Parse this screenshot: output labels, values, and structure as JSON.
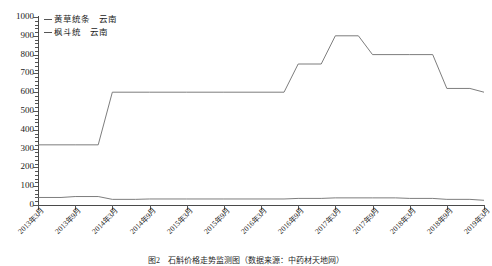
{
  "chart_data": {
    "type": "line",
    "title": "",
    "xlabel": "",
    "ylabel": "",
    "ylim": [
      0,
      1000
    ],
    "ytick_step": 100,
    "grid": false,
    "legend_position": "top-left",
    "categories": [
      "2013年3月",
      "2013年9月",
      "2014年3月",
      "2014年9月",
      "2015年3月",
      "2015年9月",
      "2016年3月",
      "2016年9月",
      "2017年3月",
      "2017年9月",
      "2018年3月",
      "2018年9月",
      "2019年3月"
    ],
    "yticks": [
      "0",
      "100",
      "200",
      "300",
      "400",
      "500",
      "600",
      "700",
      "800",
      "900",
      "1000"
    ],
    "series": [
      {
        "name": "黄草统条　云南",
        "color": "#6e6e6e",
        "values": [
          320,
          320,
          600,
          600,
          600,
          600,
          600,
          750,
          900,
          800,
          800,
          620,
          600
        ]
      },
      {
        "name": "枫斗统　云南",
        "color": "#6e6e6e",
        "values": [
          40,
          45,
          30,
          32,
          32,
          32,
          32,
          35,
          38,
          38,
          35,
          30,
          25
        ]
      }
    ]
  },
  "legend": {
    "entries": [
      {
        "dash": "—",
        "label": "黄草统条",
        "region": "云南"
      },
      {
        "dash": "—",
        "label": "枫斗统",
        "region": "云南"
      }
    ]
  },
  "caption": {
    "text": "图2　石斛价格走势监测图（数据来源：中药材天地网）"
  }
}
